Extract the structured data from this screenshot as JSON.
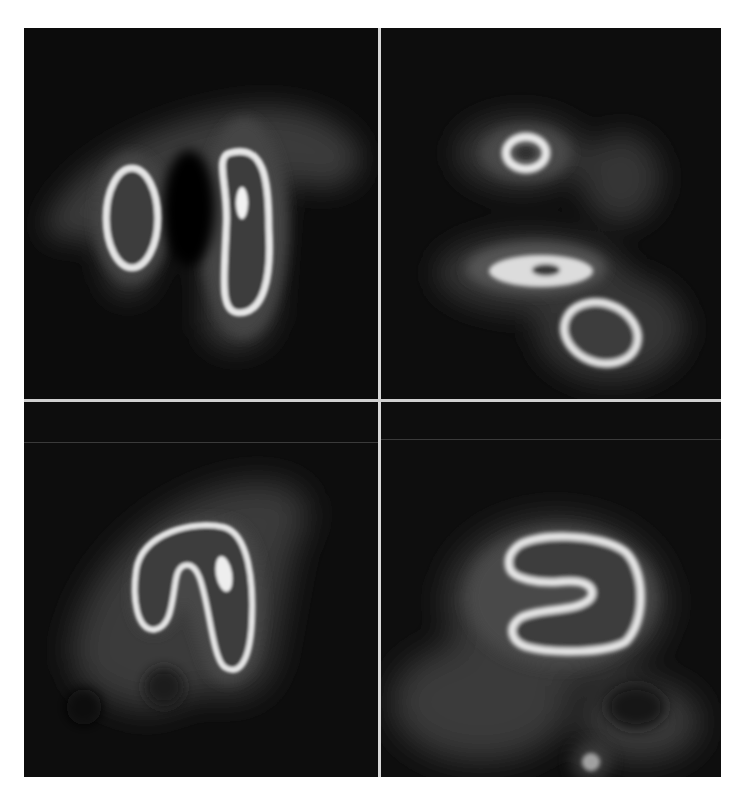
{
  "figure": {
    "layout": "2x2 grid",
    "colors": {
      "background": "#0b0b0b",
      "tissue_halo": "#3c3c3c",
      "ring_bright": "#e6e6e6",
      "divider": "#d8d8d8",
      "page": "#ffffff"
    },
    "panels": [
      {
        "position": "top-left",
        "content": "two vertical oval rings side by side, right ring larger with a bright hot spot"
      },
      {
        "position": "top-right",
        "content": "small donut ring at top, horizontal bright band in middle, tilted oval ring at bottom right"
      },
      {
        "position": "bottom-left",
        "content": "inverted U / n-shaped bright loop with bright spot on right arm"
      },
      {
        "position": "bottom-right",
        "content": "S-shaped bright loop with small bright spot near bottom"
      }
    ]
  }
}
